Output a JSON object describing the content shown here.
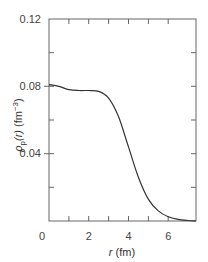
{
  "chart_data": {
    "type": "line",
    "title": "",
    "xlabel": "r (fm)",
    "ylabel": "ρp(r) (fm⁻³)",
    "xlim": [
      0,
      7.4
    ],
    "ylim": [
      0,
      0.12
    ],
    "x_ticks_labeled": [
      "0",
      "2",
      "4",
      "6"
    ],
    "y_ticks_labeled": [
      "0.04",
      "0.08",
      "0.12"
    ],
    "grid": false,
    "legend": null,
    "series": [
      {
        "name": "proton density",
        "x": [
          0,
          0.5,
          1.0,
          1.5,
          2.0,
          2.5,
          3.0,
          3.5,
          4.0,
          4.5,
          5.0,
          5.5,
          6.0,
          6.5,
          7.0,
          7.4
        ],
        "y": [
          0.081,
          0.08,
          0.078,
          0.0775,
          0.0775,
          0.077,
          0.073,
          0.062,
          0.044,
          0.026,
          0.013,
          0.006,
          0.0025,
          0.001,
          0.0003,
          0.0
        ]
      }
    ]
  },
  "labels": {
    "x_axis": "r (fm)",
    "y_axis_rho": "ρ",
    "y_axis_sub": "p",
    "y_axis_rest": "(r) (fm",
    "y_axis_sup": "−3",
    "y_axis_close": ")",
    "y_tick_012": "0.12",
    "y_tick_008": "0.08",
    "y_tick_004": "0.04",
    "x_tick_0": "0",
    "x_tick_2": "2",
    "x_tick_4": "4",
    "x_tick_6": "6"
  }
}
